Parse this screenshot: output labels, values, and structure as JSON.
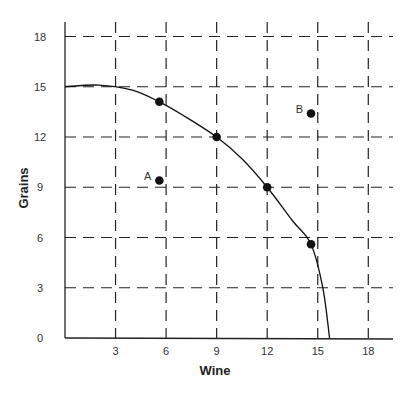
{
  "chart_data": {
    "type": "line",
    "title": "",
    "xlabel": "Wine",
    "ylabel": "Grains",
    "xlim": [
      0,
      19.5
    ],
    "ylim": [
      0,
      18.5
    ],
    "x_ticks": [
      3,
      6,
      9,
      12,
      15,
      18
    ],
    "y_ticks": [
      0,
      3,
      6,
      9,
      12,
      15,
      18
    ],
    "x_tick_labels": [
      "3",
      "6",
      "9",
      "12",
      "15",
      "18"
    ],
    "y_tick_labels": [
      "0",
      "3",
      "6",
      "9",
      "12",
      "15",
      "18"
    ],
    "grid": "dashed",
    "legend": null,
    "series": [
      {
        "name": "Production possibilities frontier",
        "kind": "curve",
        "x": [
          0,
          2,
          4,
          5.6,
          7,
          9,
          10.5,
          12,
          13.5,
          14.6,
          15.3,
          15.7
        ],
        "y": [
          15,
          15.1,
          14.8,
          14.1,
          13.3,
          12,
          10.7,
          9,
          7,
          5.6,
          3,
          0
        ]
      },
      {
        "name": "Points on frontier",
        "kind": "scatter",
        "x": [
          5.6,
          9,
          12,
          14.6
        ],
        "y": [
          14.1,
          12,
          9,
          5.6
        ]
      },
      {
        "name": "Labeled points",
        "kind": "scatter",
        "points": [
          {
            "label": "A",
            "x": 5.6,
            "y": 9.4
          },
          {
            "label": "B",
            "x": 14.6,
            "y": 13.4
          }
        ]
      }
    ]
  },
  "labels": {
    "x_axis": "Wine",
    "y_axis": "Grains",
    "point_a": "A",
    "point_b": "B"
  }
}
